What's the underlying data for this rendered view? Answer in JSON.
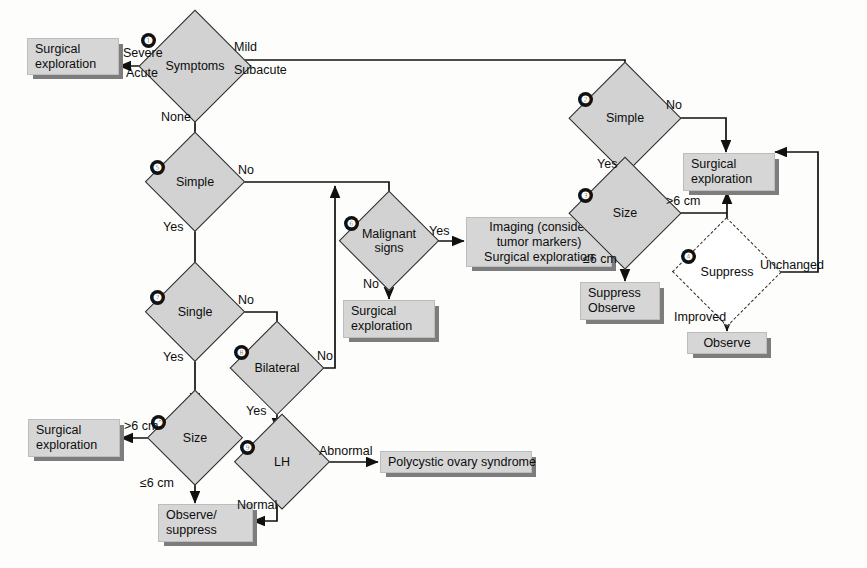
{
  "diagram": {
    "nodes": [
      {
        "id": "n1",
        "num": "❶",
        "label": "Symptoms"
      },
      {
        "id": "n2",
        "num": "❷",
        "label": "Simple"
      },
      {
        "id": "n3",
        "num": "❸",
        "label": "Size"
      },
      {
        "id": "n4",
        "num": "❹",
        "label": "Suppress"
      },
      {
        "id": "n5",
        "num": "❺",
        "label": "Simple"
      },
      {
        "id": "n6",
        "num": "❻",
        "label": "Malignant\nsigns"
      },
      {
        "id": "n7",
        "num": "❼",
        "label": "Single"
      },
      {
        "id": "n8",
        "num": "❽",
        "label": "Bilateral"
      },
      {
        "id": "n9",
        "num": "❾",
        "label": "LH"
      },
      {
        "id": "n10",
        "num": "❿",
        "label": "Size"
      }
    ],
    "boxes": [
      {
        "id": "b1",
        "label": "Surgical\nexploration"
      },
      {
        "id": "b2",
        "label": "Surgical\nexploration"
      },
      {
        "id": "b3",
        "label": "Suppress\nObserve"
      },
      {
        "id": "b4",
        "label": "Observe"
      },
      {
        "id": "b5",
        "label": "Imaging (consider\ntumor markers)\nSurgical exploration"
      },
      {
        "id": "b6",
        "label": "Surgical\nexploration"
      },
      {
        "id": "b7",
        "label": "Surgical\nexploration"
      },
      {
        "id": "b8",
        "label": "Polycystic ovary syndrome"
      },
      {
        "id": "b9",
        "label": "Observe/\nsuppress"
      }
    ],
    "edge_labels": {
      "severe": "Severe",
      "acute": "Acute",
      "mild": "Mild",
      "subacute": "Subacute",
      "none": "None",
      "n2_no": "No",
      "n2_yes": "Yes",
      "n3_gt6": ">6 cm",
      "n3_le6": "≤6 cm",
      "n4_unchanged": "Unchanged",
      "n4_improved": "Improved",
      "n5_no": "No",
      "n5_yes": "Yes",
      "n6_yes": "Yes",
      "n6_no": "No",
      "n7_no": "No",
      "n7_yes": "Yes",
      "n8_no": "No",
      "n8_yes": "Yes",
      "n9_abnormal": "Abnormal",
      "n9_normal": "Normal",
      "n10_gt6": ">6 cm",
      "n10_le6": "≤6 cm"
    },
    "colors": {
      "box_fill": "#d6d6d6",
      "diamond_fill": "#d2d2d2",
      "shadow": "#7d7d7d",
      "stroke": "#2b2b2b",
      "text": "#0d0d0d"
    }
  }
}
